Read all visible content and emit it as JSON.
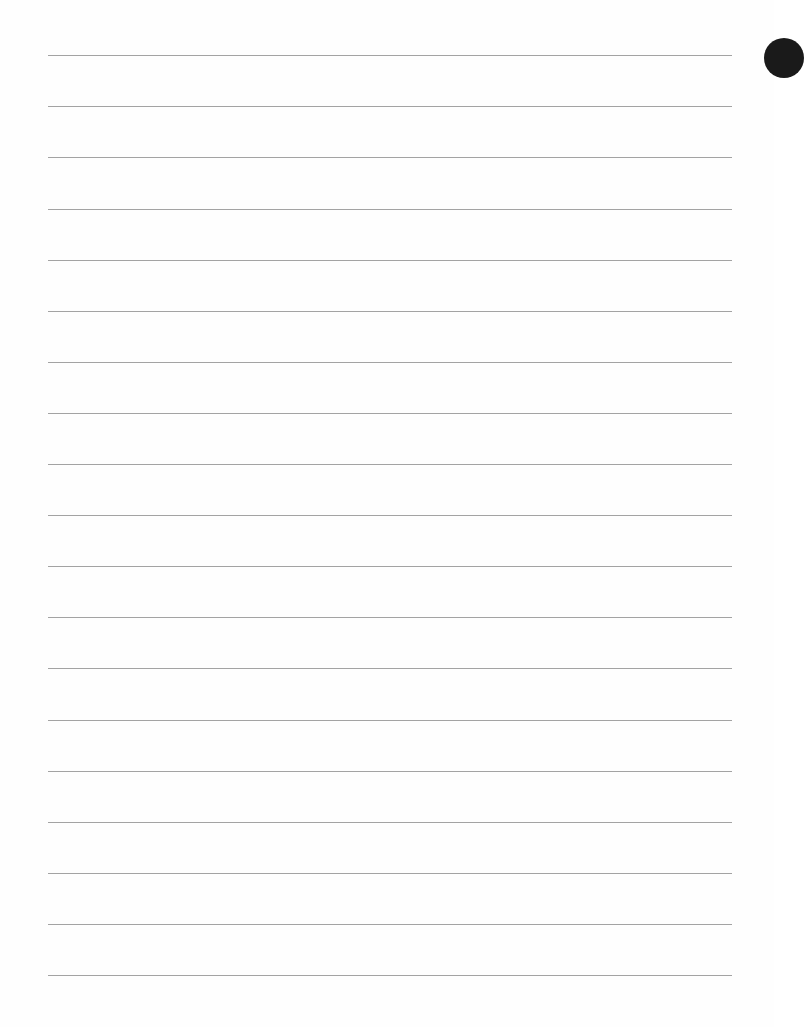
{
  "page": {
    "type": "blank-lined-paper",
    "line_color": "#a3a3a3",
    "background": "#fefefe",
    "line_left": 48,
    "line_width": 684,
    "line_positions": [
      55,
      106,
      157,
      209,
      260,
      311,
      362,
      413,
      464,
      515,
      566,
      617,
      668,
      720,
      771,
      822,
      873,
      924,
      975
    ],
    "hole_punches": [
      {
        "x": 764,
        "y": 38
      }
    ]
  }
}
